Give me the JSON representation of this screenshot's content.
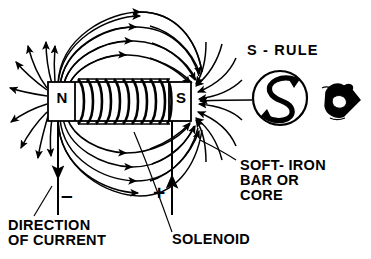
{
  "figure": {
    "ink_color": "#000000",
    "background_color": "#ffffff"
  },
  "labels": {
    "direction_of_current": "DIRECTION\nOF CURRENT",
    "solenoid": "SOLENOID",
    "soft_iron": "SOFT- IRON\nBAR OR\nCORE",
    "s_rule": "S - RULE",
    "north_pole": "N",
    "south_pole": "S",
    "negative_terminal": "–",
    "positive_terminal": "+"
  },
  "diagram": {
    "core": {
      "north_box": {
        "x": 48,
        "y": 82,
        "w": 27,
        "h": 39
      },
      "south_box": {
        "x": 169,
        "y": 82,
        "w": 22,
        "h": 39
      },
      "bar": {
        "x": 48,
        "y": 82,
        "w": 143,
        "h": 39
      }
    },
    "coil": {
      "turns": 11,
      "x_start": 76,
      "x_end": 170,
      "y_top": 79,
      "y_bottom": 124
    },
    "leads": {
      "negative": {
        "x": 58,
        "y_top": 121,
        "y_bottom": 215,
        "arrow": "down"
      },
      "positive": {
        "x": 172,
        "y_top": 121,
        "y_bottom": 215,
        "arrow": "up"
      }
    },
    "field_lines": {
      "arc_count_top": 4,
      "arc_count_bottom": 4,
      "radial_count_north": 9,
      "radial_count_south": 9,
      "arrow_direction": "north-to-south outside core"
    },
    "s_rule_symbol": {
      "circle_center_x": 280,
      "circle_center_y": 98,
      "circle_r": 27
    },
    "hand_symbol": {
      "x": 320,
      "y": 84,
      "w": 40,
      "h": 38
    }
  }
}
